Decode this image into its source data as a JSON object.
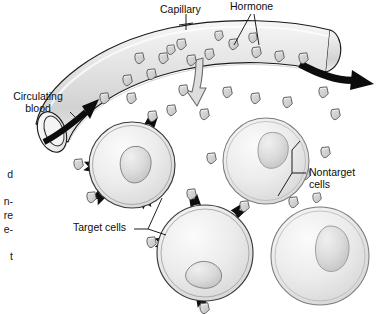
{
  "figure": {
    "kind": "biology-diagram",
    "topic": "Hormone transport in capillary to target and nontarget cells",
    "background_color": "#ffffff",
    "ink_color": "#111111",
    "cell_fill": "#e9e9e9",
    "vessel_fill": "#e3e3e3",
    "hormone_fill": "#cfcfcf",
    "receptor_color": "#111111"
  },
  "labels": {
    "capillary": "Capillary",
    "hormone": "Hormone",
    "circulating_blood": "Circulating\nblood",
    "target_cells": "Target cells",
    "nontarget_cells": "Nontarget\ncells"
  },
  "margin_text_fragments": [
    "d",
    "n-",
    "re",
    "e-",
    "t"
  ],
  "structures": {
    "capillary": {
      "name": "capillary",
      "description": "curved tube arcing from lower-left to upper-right",
      "open_end": "left elliptical lumen",
      "flow_in_arrow": "black arrow entering left lumen",
      "flow_out_arrow": "black curved arrow exiting right end"
    },
    "diffusion_arrow": {
      "name": "hormone-diffusion-arrow",
      "description": "gray outlined arrow pointing down out of vessel wall"
    },
    "cells": [
      {
        "id": "cell-1",
        "type": "target",
        "receptors": true,
        "nucleus": true
      },
      {
        "id": "cell-2",
        "type": "nontarget",
        "receptors": false,
        "nucleus": true
      },
      {
        "id": "cell-3",
        "type": "target",
        "receptors": true,
        "nucleus": true
      },
      {
        "id": "cell-4",
        "type": "nontarget",
        "receptors": false,
        "nucleus": true
      }
    ],
    "hormone_particle": {
      "name": "hormone-particle",
      "shape": "shield / rounded pentagon",
      "count_inside_vessel": 16,
      "count_outside_vessel": 14,
      "count_bound_to_receptors": 7
    }
  }
}
